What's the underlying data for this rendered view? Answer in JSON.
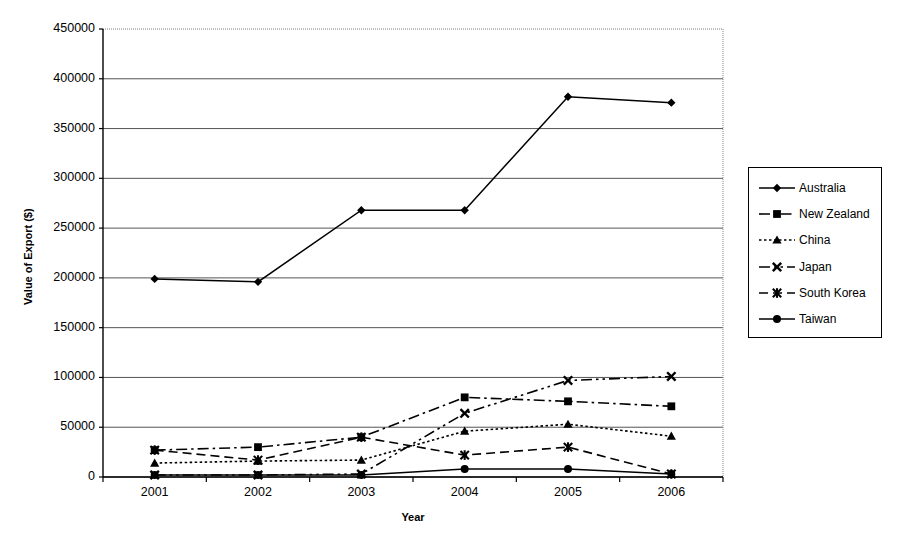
{
  "chart_data": {
    "type": "line",
    "title": "",
    "xlabel": "Year",
    "ylabel": "Value of Export ($)",
    "categories": [
      "2001",
      "2002",
      "2003",
      "2004",
      "2005",
      "2006"
    ],
    "ylim": [
      0,
      450000
    ],
    "ytick_step": 50000,
    "yticks": [
      "0",
      "50000",
      "100000",
      "150000",
      "200000",
      "250000",
      "300000",
      "350000",
      "400000",
      "450000"
    ],
    "ytick_values": [
      0,
      50000,
      100000,
      150000,
      200000,
      250000,
      300000,
      350000,
      400000,
      450000
    ],
    "grid": "horizontal",
    "legend_position": "right-outside",
    "series": [
      {
        "name": "Australia",
        "marker": "diamond",
        "line_style": "solid",
        "values": [
          199000,
          196000,
          268000,
          268000,
          382000,
          376000
        ]
      },
      {
        "name": "New Zealand",
        "marker": "square",
        "line_style": "dash-dot",
        "values": [
          27000,
          30000,
          40000,
          80000,
          76000,
          71000
        ]
      },
      {
        "name": "China",
        "marker": "triangle",
        "line_style": "dotted",
        "values": [
          14000,
          16000,
          17000,
          46000,
          53000,
          41000
        ]
      },
      {
        "name": "Japan",
        "marker": "x",
        "line_style": "dash-dot-dot",
        "values": [
          2000,
          2000,
          3000,
          64000,
          97000,
          101000
        ]
      },
      {
        "name": "South Korea",
        "marker": "asterisk",
        "line_style": "dashed",
        "values": [
          27000,
          17000,
          40000,
          22000,
          30000,
          3000
        ]
      },
      {
        "name": "Taiwan",
        "marker": "circle",
        "line_style": "solid",
        "values": [
          2000,
          2000,
          2000,
          8000,
          8000,
          3000
        ]
      }
    ]
  },
  "style": {
    "line_color": "#000000",
    "grid_color": "#555555",
    "axis_color": "#000000",
    "background": "#ffffff"
  }
}
